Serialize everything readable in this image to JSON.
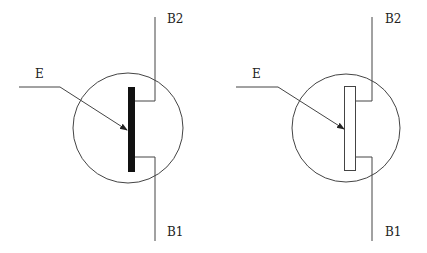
{
  "diagram": {
    "colors": {
      "stroke": "#444444",
      "fill_solid": "#111111",
      "background": "#ffffff"
    },
    "symbols": [
      {
        "name": "filled-bar-ujt",
        "labels": {
          "emitter": "E",
          "base2": "B2",
          "base1": "B1"
        },
        "bar_style": "filled"
      },
      {
        "name": "hollow-bar-ujt",
        "labels": {
          "emitter": "E",
          "base2": "B2",
          "base1": "B1"
        },
        "bar_style": "outline"
      }
    ]
  }
}
